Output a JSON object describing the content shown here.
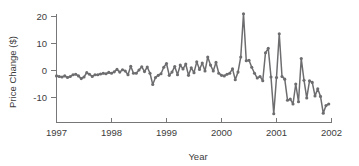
{
  "chart_data": {
    "type": "line",
    "title": "",
    "subtitle": "",
    "xlabel": "Year",
    "ylabel": "Price Change ($)",
    "xlim": [
      1997.0,
      2002.0
    ],
    "ylim": [
      -17.5,
      22.0
    ],
    "xticks": [
      1997,
      1998,
      1999,
      2000,
      2001,
      2002
    ],
    "xtick_labels": [
      "1997",
      "1998",
      "1999",
      "2000",
      "2001",
      "2002"
    ],
    "yticks": [
      -10,
      0,
      10,
      20
    ],
    "ytick_labels": [
      "-10",
      "0",
      "10",
      "20"
    ],
    "grid": false,
    "legend": "none",
    "marker": "circle",
    "line_color": "#6d6d70",
    "marker_color": "#6d6d70",
    "axis_color": "#77777a",
    "background_color": "#ffffff",
    "series": [
      {
        "name": "Price Change",
        "x": [
          1997.0,
          1997.05,
          1997.1,
          1997.15,
          1997.2,
          1997.25,
          1997.3,
          1997.35,
          1997.4,
          1997.45,
          1997.5,
          1997.55,
          1997.6,
          1997.65,
          1997.7,
          1997.75,
          1997.8,
          1997.85,
          1997.9,
          1997.95,
          1998.0,
          1998.05,
          1998.1,
          1998.15,
          1998.2,
          1998.25,
          1998.3,
          1998.35,
          1998.4,
          1998.45,
          1998.5,
          1998.55,
          1998.6,
          1998.65,
          1998.7,
          1998.75,
          1998.8,
          1998.85,
          1998.9,
          1998.95,
          1999.0,
          1999.05,
          1999.1,
          1999.15,
          1999.2,
          1999.25,
          1999.3,
          1999.35,
          1999.4,
          1999.45,
          1999.5,
          1999.55,
          1999.6,
          1999.65,
          1999.7,
          1999.75,
          1999.8,
          1999.85,
          1999.9,
          1999.95,
          2000.0,
          2000.05,
          2000.1,
          2000.15,
          2000.2,
          2000.25,
          2000.3,
          2000.35,
          2000.4,
          2000.45,
          2000.5,
          2000.55,
          2000.6,
          2000.65,
          2000.7,
          2000.75,
          2000.8,
          2000.85,
          2000.9,
          2000.95,
          2001.0,
          2001.05,
          2001.1,
          2001.15,
          2001.2,
          2001.25,
          2001.3,
          2001.35,
          2001.4,
          2001.45,
          2001.5,
          2001.55,
          2001.6,
          2001.65,
          2001.7,
          2001.75,
          2001.8,
          2001.85,
          2001.9,
          2001.95
        ],
        "y": [
          -2.0,
          -2.2,
          -2.4,
          -2.0,
          -2.6,
          -2.2,
          -1.6,
          -1.4,
          -2.0,
          -3.0,
          -2.4,
          -0.8,
          -1.4,
          -2.2,
          -1.6,
          -1.6,
          -1.3,
          -1.0,
          -1.2,
          -0.7,
          -1.0,
          -0.5,
          0.4,
          -0.6,
          0.3,
          -0.2,
          -1.6,
          1.6,
          -1.0,
          -1.0,
          0.2,
          1.4,
          -0.4,
          1.3,
          -1.0,
          -5.2,
          -2.6,
          -1.8,
          -1.2,
          1.2,
          2.6,
          -1.8,
          -0.6,
          1.5,
          -1.6,
          2.0,
          0.6,
          2.4,
          -1.8,
          1.0,
          -0.8,
          3.2,
          0.4,
          2.8,
          -0.2,
          5.0,
          2.0,
          -0.2,
          3.0,
          -1.0,
          -1.8,
          -2.0,
          -1.4,
          -1.0,
          0.6,
          -3.4,
          -0.6,
          5.0,
          21.0,
          3.6,
          3.8,
          1.2,
          -1.0,
          -2.8,
          -2.2,
          -3.8,
          6.6,
          8.2,
          -2.4,
          -16.0,
          -2.6,
          13.6,
          -2.2,
          -3.2,
          -11.0,
          -10.6,
          -12.4,
          -5.0,
          -11.6,
          4.4,
          -3.6,
          -10.2,
          -3.8,
          -4.4,
          -9.4,
          -6.8,
          -9.6,
          -15.8,
          -13.0,
          -12.4
        ]
      }
    ]
  },
  "axes": {
    "ylabel_text": "Price Change ($)",
    "xlabel_text": "Year"
  }
}
